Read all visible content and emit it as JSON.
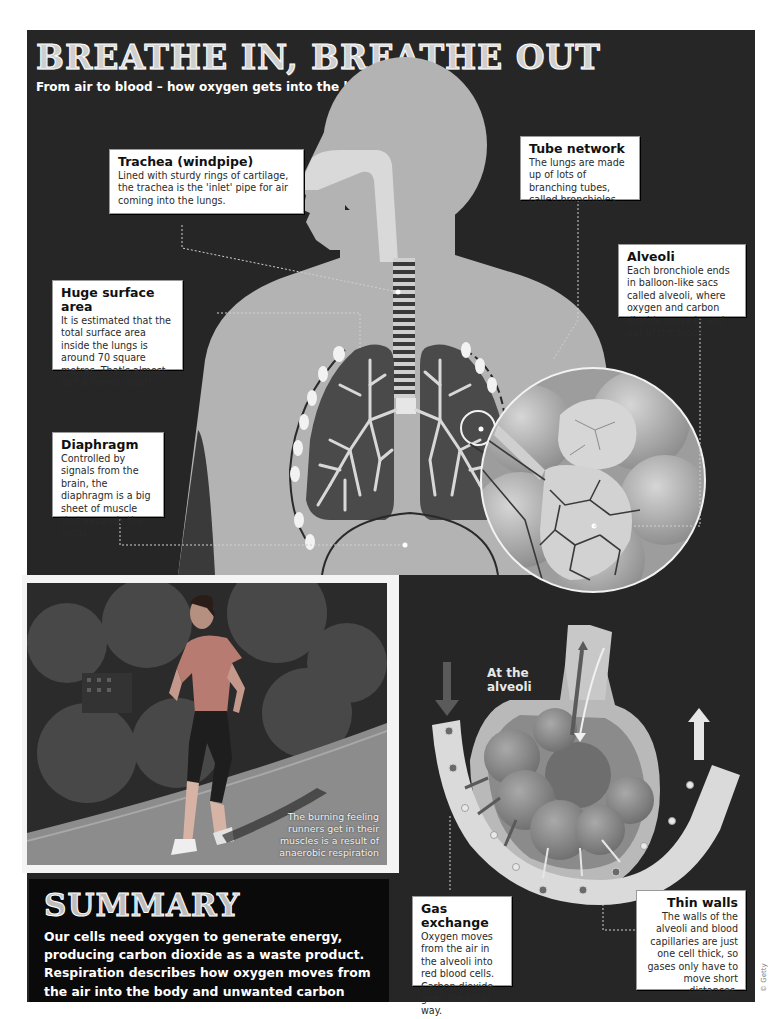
{
  "header": {
    "title": "BREATHE IN, BREATHE OUT",
    "subtitle": "From air to blood – how oxygen gets into the body"
  },
  "callouts": {
    "trachea": {
      "title": "Trachea (windpipe)",
      "body": "Lined with sturdy rings of cartilage, the trachea is the 'inlet' pipe for air coming into the lungs."
    },
    "tube_network": {
      "title": "Tube network",
      "body": "The lungs are made up of lots of branching tubes, called bronchioles."
    },
    "alveoli": {
      "title": "Alveoli",
      "body": "Each bronchiole ends in balloon-like sacs called alveoli, where oxygen and carbon dioxide move in and out of the blood."
    },
    "surface_area": {
      "title": "Huge surface area",
      "body": "It is estimated that the total surface area inside the lungs is around 70 square metres. That's almost half a tennis court!"
    },
    "diaphragm": {
      "title": "Diaphragm",
      "body": "Controlled by signals from the brain, the diaphragm is a big sheet of muscle that expands the lungs."
    },
    "gas_exchange": {
      "title": "Gas exchange",
      "body": "Oxygen moves from the air in the alveoli into red blood cells. Carbon dioxide goes the other way."
    },
    "thin_walls": {
      "title": "Thin walls",
      "body": "The walls of the alveoli and blood capillaries are just one cell thick, so gases only have to move short distances."
    }
  },
  "alveoli_diagram": {
    "label": "At the alveoli"
  },
  "photo": {
    "caption": "The burning feeling runners get in their muscles is a result of anaerobic respiration"
  },
  "summary": {
    "title": "SUMMARY",
    "body": "Our cells need oxygen to generate energy, producing carbon dioxide as a waste product. Respiration describes how oxygen moves from the air into the body and unwanted carbon dioxide gets back out."
  },
  "credit": "© Getty",
  "colors": {
    "background_dark": "#262626",
    "body_silhouette": "#b3b3b3",
    "lung_fill": "#4a4a4a",
    "bronchiole": "#d8d8d8",
    "callout_bg": "#ffffff",
    "summary_bg": "#0a0a0a"
  }
}
